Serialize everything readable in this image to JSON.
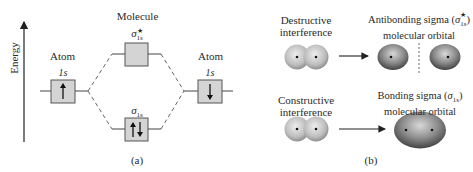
{
  "panel_a": {
    "axis_label": "Energy",
    "caption": "(a)",
    "molecule_label": "Molecule",
    "left_atom": {
      "label": "Atom",
      "orbital": "1s",
      "electrons": "up"
    },
    "right_atom": {
      "label": "Atom",
      "orbital": "1s",
      "electrons": "down"
    },
    "antibonding": {
      "symbol": "σ",
      "sub": "1s",
      "sup": "★",
      "electrons": "none"
    },
    "bonding": {
      "symbol": "σ",
      "sub": "1s",
      "electrons": "up-down"
    }
  },
  "panel_b": {
    "caption": "(b)",
    "rows": [
      {
        "input_label_line1": "Destructive",
        "input_label_line2": "interference",
        "result_label_line1": "Antibonding sigma (",
        "result_symbol": "σ",
        "result_sup": "★",
        "result_sub": "1s",
        "result_close": ")",
        "result_label_line2": "molecular orbital"
      },
      {
        "input_label_line1": "Constructive",
        "input_label_line2": "interference",
        "result_label_line1": "Bonding sigma (",
        "result_symbol": "σ",
        "result_sub": "1s",
        "result_close": ")",
        "result_label_line2": "molecular orbital"
      }
    ]
  },
  "colors": {
    "box_fill": "#d4d4d4",
    "box_stroke": "#555555",
    "line": "#444444",
    "sphere_light": "#e6e6e6",
    "sphere_dark": "#8a8a8a",
    "orbital_light": "#c8c8c8",
    "orbital_dark": "#3c3c3c"
  }
}
